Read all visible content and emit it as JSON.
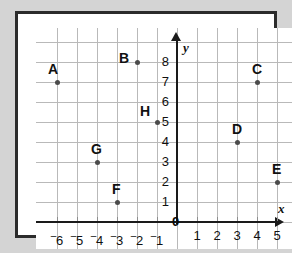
{
  "chart_data": {
    "type": "scatter",
    "title": "",
    "xlabel": "x",
    "ylabel": "y",
    "xlim": [
      -6.9,
      6.9
    ],
    "ylim": [
      -0.45,
      9.2
    ],
    "grid": true,
    "legend": "none",
    "x_ticks": [
      "-6",
      "-5",
      "-4",
      "-3",
      "-2",
      "-1",
      "1",
      "2",
      "3",
      "4",
      "5",
      "6"
    ],
    "x_tick_values": [
      -6,
      -5,
      -4,
      -3,
      -2,
      -1,
      1,
      2,
      3,
      4,
      5,
      6
    ],
    "y_ticks": [
      "1",
      "2",
      "3",
      "4",
      "5",
      "6",
      "7",
      "8"
    ],
    "y_tick_values": [
      1,
      2,
      3,
      4,
      5,
      6,
      7,
      8
    ],
    "origin_label": "0",
    "points": [
      {
        "label": "A",
        "x": -6,
        "y": 7,
        "label_dx": -9,
        "label_dy": -20
      },
      {
        "label": "B",
        "x": -2,
        "y": 8,
        "label_dx": -18,
        "label_dy": -11
      },
      {
        "label": "C",
        "x": 4,
        "y": 7,
        "label_dx": -5,
        "label_dy": -20
      },
      {
        "label": "D",
        "x": 3,
        "y": 4,
        "label_dx": -5,
        "label_dy": -20
      },
      {
        "label": "E",
        "x": 5,
        "y": 2,
        "label_dx": -5,
        "label_dy": -20
      },
      {
        "label": "F",
        "x": -3,
        "y": 1,
        "label_dx": -5,
        "label_dy": -20
      },
      {
        "label": "G",
        "x": -4,
        "y": 3,
        "label_dx": -6,
        "label_dy": -20
      },
      {
        "label": "H",
        "x": -1,
        "y": 5,
        "label_dx": -17,
        "label_dy": -18
      },
      {
        "label": "I",
        "x": 6,
        "y": 6,
        "label_dx": -3,
        "label_dy": -20
      }
    ]
  },
  "colors": {
    "background": "#d4d4d4",
    "plot_background": "#ffffff",
    "frame": "#2b2b2b",
    "gridline": "#b9b9b9",
    "axis": "#1a1a1a",
    "point": "#4a4a4a",
    "text": "#111111"
  }
}
